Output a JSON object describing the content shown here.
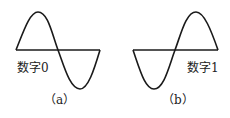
{
  "figures": [
    {
      "id": "a",
      "bit_label": "数字0",
      "caption": "（a）",
      "waveform": "sine starting upward (0° phase)"
    },
    {
      "id": "b",
      "bit_label": "数字1",
      "caption": "（b）",
      "waveform": "sine starting downward (180° phase)"
    }
  ],
  "colors": {
    "stroke": "#1a1a1a",
    "background": "#ffffff"
  }
}
